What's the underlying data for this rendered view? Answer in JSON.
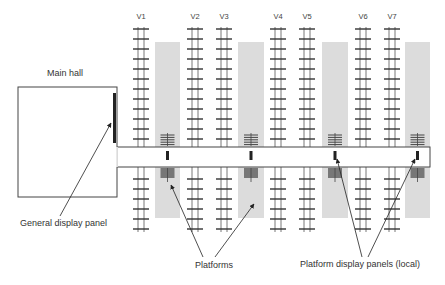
{
  "labels": {
    "main_hall": "Main hall",
    "general_display_panel": "General display panel",
    "platforms": "Platforms",
    "platform_display_panels": "Platform display panels (local)"
  },
  "tracks": [
    {
      "label": "V1",
      "x": 141
    },
    {
      "label": "V2",
      "x": 195
    },
    {
      "label": "V3",
      "x": 224
    },
    {
      "label": "V4",
      "x": 278
    },
    {
      "label": "V5",
      "x": 307
    },
    {
      "label": "V6",
      "x": 363
    },
    {
      "label": "V7",
      "x": 392
    }
  ],
  "platforms": [
    {
      "x": 155,
      "w": 25
    },
    {
      "x": 238,
      "w": 26
    },
    {
      "x": 322,
      "w": 26
    },
    {
      "x": 405,
      "w": 25
    }
  ],
  "colors": {
    "platform_fill": "#dcdcdc",
    "line": "#333333",
    "panel": "#222222"
  }
}
